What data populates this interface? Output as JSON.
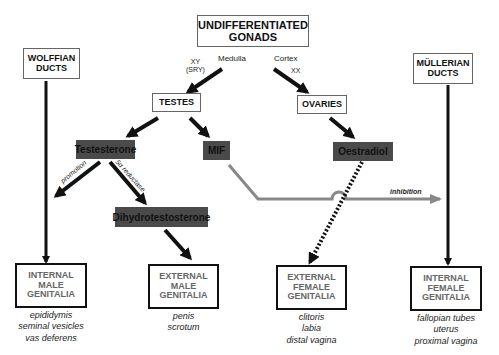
{
  "title_box": {
    "line1": "UNDIFFERENTIATED",
    "line2": "GONADS"
  },
  "labels": {
    "medulla": "Medulla",
    "cortex": "Cortex",
    "xy": "XY",
    "sry": "(SRY)",
    "xx": "XX",
    "promotion": "promotion",
    "reductase": "5α reductase",
    "inhibition": "inhibition"
  },
  "ducts": {
    "wolffian": {
      "line1": "WOLFFIAN",
      "line2": "DUCTS"
    },
    "mullerian": {
      "line1": "MÜLLERIAN",
      "line2": "DUCTS"
    }
  },
  "gonads": {
    "testes": "TESTES",
    "ovaries": "OVARIES"
  },
  "hormones": {
    "testosterone": "Testesterone",
    "mif": "MIF",
    "oestradiol": "Oestradiol",
    "dht": "Dihydrotestosterone"
  },
  "outcomes": [
    {
      "line1": "INTERNAL",
      "line2": "MALE",
      "line3": "GENITALIA",
      "items": [
        "epididymis",
        "seminal vesicles",
        "vas deferens"
      ]
    },
    {
      "line1": "EXTERNAL",
      "line2": "MALE",
      "line3": "GENITALIA",
      "items": [
        "penis",
        "scrotum"
      ]
    },
    {
      "line1": "EXTERNAL",
      "line2": "FEMALE",
      "line3": "GENITALIA",
      "items": [
        "clitoris",
        "labia",
        "distal vagina"
      ]
    },
    {
      "line1": "INTERNAL",
      "line2": "FEMALE",
      "line3": "GENITALIA",
      "items": [
        "fallopian tubes",
        "uterus",
        "proximal vagina"
      ]
    }
  ],
  "colors": {
    "hormone_fill": "#4a4a4a",
    "inhibition_line": "#888888",
    "arrow": "#111111"
  }
}
